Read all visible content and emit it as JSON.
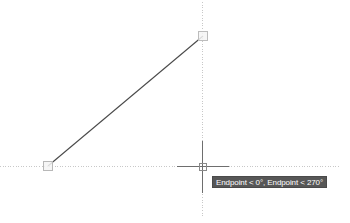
{
  "app": {
    "name": "cad-drawing-canvas",
    "background_color": "#ffffff"
  },
  "colors": {
    "line_stroke": "#4a4a4a",
    "tracking_line": "#c8c8c8",
    "crosshair": "#707070",
    "snap_marker_fill": "#f2f2f2",
    "snap_marker_stroke": "#b4b4b4",
    "tooltip_bg": "#575757",
    "tooltip_text": "#ffffff",
    "ghost_text": "#dedede"
  },
  "geometry": {
    "line": {
      "name": "diagonal-line",
      "start": {
        "x": 48,
        "y": 166
      },
      "end": {
        "x": 203,
        "y": 36
      }
    },
    "snap_markers": [
      {
        "label": "endpoint-start",
        "x": 48,
        "y": 166,
        "size": 9
      },
      {
        "label": "endpoint-end",
        "x": 203,
        "y": 36,
        "size": 9
      }
    ],
    "tracking_lines": {
      "horizontal": {
        "y": 166,
        "x1": 0,
        "x2": 341
      },
      "vertical": {
        "x": 202,
        "y1": 2,
        "y2": 216
      }
    },
    "crosshair": {
      "center": {
        "x": 202,
        "y": 166
      },
      "arm_length": 26,
      "pick_box_size": 7
    }
  },
  "tooltip": {
    "name": "osnap-tooltip",
    "text": "Endpoint < 0°, Endpoint < 270°",
    "entries": [
      {
        "snap": "Endpoint",
        "angle": "0°"
      },
      {
        "snap": "Endpoint",
        "angle": "270°"
      }
    ],
    "position": {
      "x": 212,
      "y": 176
    }
  },
  "bottom_strip": {
    "name": "clipped-toolbar-strip",
    "ghost_glyphs": [
      {
        "text": "⌐ ⌐ ⌐",
        "x": 8
      }
    ]
  }
}
